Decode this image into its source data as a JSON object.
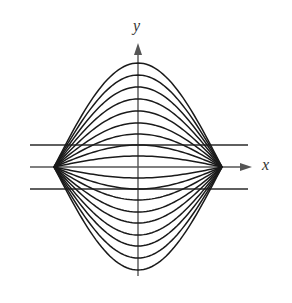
{
  "figure": {
    "axes": {
      "x_label": "x",
      "y_label": "y"
    },
    "colors": {
      "curve": "#1a1a1a",
      "axis": "#555555",
      "hline": "#2a2a2a",
      "background": "#ffffff"
    },
    "geometry": {
      "origin_px": [
        138,
        167
      ],
      "left_node_px": [
        54,
        167
      ],
      "right_node_px": [
        222,
        167
      ],
      "y_axis": {
        "x": 138,
        "top": 43,
        "bottom": 276
      },
      "x_axis": {
        "y": 167,
        "left": 30,
        "right": 252
      },
      "horizontal_lines_y": [
        145,
        189
      ],
      "horizontal_lines_x": [
        30,
        248
      ]
    },
    "curve_peaks_px": [
      63,
      75,
      87,
      99,
      111,
      123,
      134,
      145,
      156,
      178,
      189,
      200,
      212,
      223,
      235,
      246,
      258,
      270
    ]
  }
}
